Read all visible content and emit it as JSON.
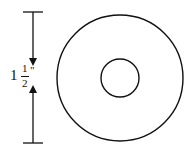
{
  "diagram": {
    "dimension_label": {
      "whole": "1",
      "numerator": "1",
      "denominator": "2",
      "unit": "\""
    },
    "dimension_value": "1 1/2 inch",
    "shapes": {
      "outer_circle": {
        "cx": 120,
        "cy": 78,
        "r": 63
      },
      "inner_circle": {
        "cx": 120,
        "cy": 78,
        "r": 19
      }
    },
    "stroke_color": "#111111",
    "background": "#ffffff"
  }
}
